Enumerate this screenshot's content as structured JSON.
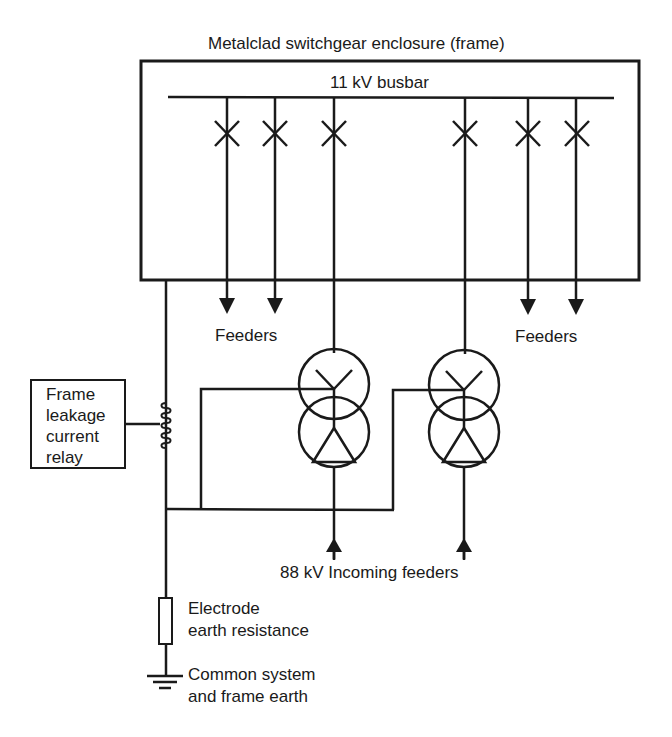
{
  "diagram": {
    "type": "single-line earthing diagram",
    "enclosure_label": "Metalclad switchgear enclosure (frame)",
    "busbar_label": "11 kV busbar",
    "feeder_groups": [
      {
        "label": "Feeders",
        "count": 2,
        "side": "left"
      },
      {
        "label": "Feeders",
        "count": 2,
        "side": "right"
      }
    ],
    "circuit_breakers": 6,
    "transformers": [
      {
        "id": "T1",
        "hv_winding": "delta",
        "lv_winding": "star"
      },
      {
        "id": "T2",
        "hv_winding": "delta",
        "lv_winding": "star"
      }
    ],
    "incoming_label": "88 kV Incoming feeders",
    "relay": {
      "label_lines": [
        "Frame",
        "leakage",
        "current",
        "relay"
      ]
    },
    "resistance_label_lines": [
      "Electrode",
      "earth resistance"
    ],
    "earth_label_lines": [
      "Common system",
      "and frame earth"
    ],
    "colors": {
      "line": "#1a1a1a",
      "background": "#ffffff"
    }
  }
}
